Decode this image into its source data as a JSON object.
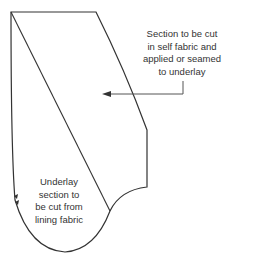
{
  "diagram": {
    "type": "pattern-piece",
    "stroke_color": "#333333",
    "labels": {
      "top": {
        "line1": "Section to be cut",
        "line2": "in self fabric and",
        "line3": "applied or seamed",
        "line4": "to underlay"
      },
      "bottom": {
        "line1": "Underlay",
        "line2": "section to",
        "line3": "be cut from",
        "line4": "lining fabric"
      }
    },
    "notches": 2
  }
}
